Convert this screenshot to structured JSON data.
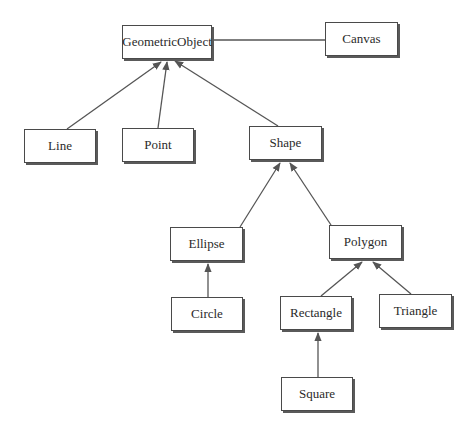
{
  "diagram": {
    "type": "class-hierarchy",
    "nodes": [
      {
        "id": "GeometricObject",
        "label": "GeometricObject",
        "x": 122,
        "y": 25,
        "w": 90,
        "h": 34
      },
      {
        "id": "Canvas",
        "label": "Canvas",
        "x": 325,
        "y": 22,
        "w": 73,
        "h": 34
      },
      {
        "id": "Line",
        "label": "Line",
        "x": 24,
        "y": 129,
        "w": 72,
        "h": 34
      },
      {
        "id": "Point",
        "label": "Point",
        "x": 122,
        "y": 128,
        "w": 72,
        "h": 34
      },
      {
        "id": "Shape",
        "label": "Shape",
        "x": 249,
        "y": 126,
        "w": 73,
        "h": 34
      },
      {
        "id": "Ellipse",
        "label": "Ellipse",
        "x": 170,
        "y": 227,
        "w": 73,
        "h": 34
      },
      {
        "id": "Polygon",
        "label": "Polygon",
        "x": 329,
        "y": 225,
        "w": 73,
        "h": 34
      },
      {
        "id": "Circle",
        "label": "Circle",
        "x": 171,
        "y": 297,
        "w": 72,
        "h": 34
      },
      {
        "id": "Rectangle",
        "label": "Rectangle",
        "x": 280,
        "y": 296,
        "w": 72,
        "h": 34
      },
      {
        "id": "Triangle",
        "label": "Triangle",
        "x": 379,
        "y": 294,
        "w": 73,
        "h": 34
      },
      {
        "id": "Square",
        "label": "Square",
        "x": 281,
        "y": 377,
        "w": 72,
        "h": 34
      }
    ],
    "edges": [
      {
        "from": "GeometricObject",
        "to": "Canvas",
        "kind": "association"
      },
      {
        "from": "Line",
        "to": "GeometricObject",
        "kind": "inheritance"
      },
      {
        "from": "Point",
        "to": "GeometricObject",
        "kind": "inheritance"
      },
      {
        "from": "Shape",
        "to": "GeometricObject",
        "kind": "inheritance"
      },
      {
        "from": "Ellipse",
        "to": "Shape",
        "kind": "inheritance"
      },
      {
        "from": "Polygon",
        "to": "Shape",
        "kind": "inheritance"
      },
      {
        "from": "Circle",
        "to": "Ellipse",
        "kind": "inheritance"
      },
      {
        "from": "Rectangle",
        "to": "Polygon",
        "kind": "inheritance"
      },
      {
        "from": "Triangle",
        "to": "Polygon",
        "kind": "inheritance"
      },
      {
        "from": "Square",
        "to": "Rectangle",
        "kind": "inheritance"
      }
    ]
  },
  "labels": {
    "geometric_object": "GeometricObject",
    "canvas": "Canvas",
    "line": "Line",
    "point": "Point",
    "shape": "Shape",
    "ellipse": "Ellipse",
    "polygon": "Polygon",
    "circle": "Circle",
    "rectangle": "Rectangle",
    "triangle": "Triangle",
    "square": "Square"
  },
  "colors": {
    "line": "#555555",
    "border": "#4a4a4a",
    "shadow": "#5a5a5a",
    "text": "#2a2a2a",
    "background": "#ffffff"
  }
}
